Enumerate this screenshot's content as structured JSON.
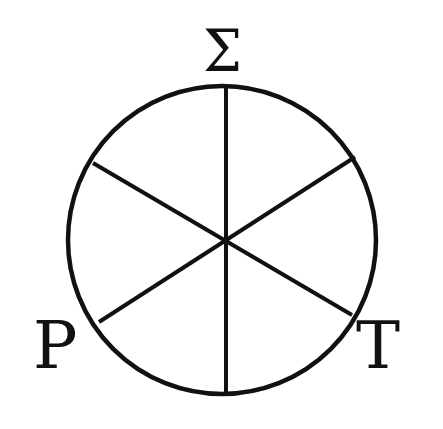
{
  "diagram": {
    "type": "circle-divided-into-six-sectors",
    "labels": {
      "top": "Σ",
      "bottom_left": "Ρ",
      "bottom_right": "Τ"
    },
    "stroke_color": "#111111",
    "background_color": "#ffffff",
    "circle": {
      "center": [
        222,
        240
      ],
      "radius": 154
    },
    "spokes": [
      {
        "name": "vertical",
        "from": [
          226,
          85
        ],
        "to": [
          226,
          396
        ]
      },
      {
        "name": "diagonal-down",
        "from": [
          93,
          163
        ],
        "to": [
          352,
          315
        ]
      },
      {
        "name": "diagonal-up",
        "from": [
          99,
          322
        ],
        "to": [
          355,
          157
        ]
      }
    ]
  }
}
